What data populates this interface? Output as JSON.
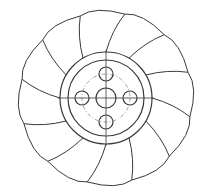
{
  "drawing": {
    "subject": "impeller technical drawing",
    "blade_count": 12,
    "center": [
      106,
      98
    ],
    "outer_hub_radius": 46,
    "inner_hub_radius": 38,
    "bolt_circle_radius": 24,
    "bolt_hole_radius": 7,
    "center_hole_radius": 10,
    "blade_tip_radius": 90,
    "colors": {
      "line": "#3a3a3a",
      "centerline": "#8a8a8a",
      "background": "#ffffff"
    }
  }
}
